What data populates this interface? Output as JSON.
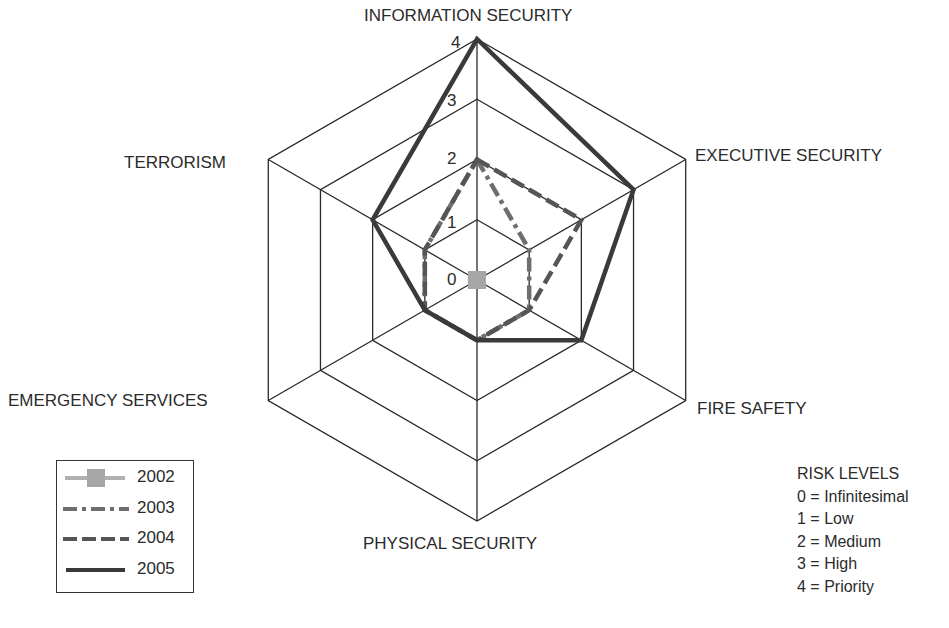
{
  "chart_data": {
    "type": "radar",
    "title": "",
    "axes": [
      "INFORMATION SECURITY",
      "EXECUTIVE SECURITY",
      "FIRE SAFETY",
      "PHYSICAL SECURITY",
      "EMERGENCY SERVICES",
      "TERRORISM"
    ],
    "range": [
      0,
      4
    ],
    "ticks": [
      "0",
      "1",
      "2",
      "3",
      "4"
    ],
    "grid": true,
    "legend_position": "bottom-left",
    "series": [
      {
        "name": "2002",
        "values": [
          0,
          0,
          0,
          0,
          0,
          0
        ],
        "style": "solid-marker",
        "color": "#a6a6a6"
      },
      {
        "name": "2003",
        "values": [
          2,
          1,
          1,
          1,
          1,
          1
        ],
        "style": "dash-dot",
        "color": "#6e6e6e"
      },
      {
        "name": "2004",
        "values": [
          2,
          2,
          1,
          1,
          1,
          1
        ],
        "style": "dashed",
        "color": "#555555"
      },
      {
        "name": "2005",
        "values": [
          4,
          3,
          2,
          1,
          1,
          2
        ],
        "style": "solid",
        "color": "#3a3a3a"
      }
    ]
  },
  "axis_labels": {
    "information_security": "INFORMATION SECURITY",
    "executive_security": "EXECUTIVE SECURITY",
    "fire_safety": "FIRE SAFETY",
    "physical_security": "PHYSICAL SECURITY",
    "emergency_services": "EMERGENCY SERVICES",
    "terrorism": "TERRORISM"
  },
  "ticks": [
    "0",
    "1",
    "2",
    "3",
    "4"
  ],
  "legend": {
    "items": [
      {
        "label": "2002"
      },
      {
        "label": "2003"
      },
      {
        "label": "2004"
      },
      {
        "label": "2005"
      }
    ]
  },
  "risk_levels": {
    "title": "RISK LEVELS",
    "items": [
      "0 = Infinitesimal",
      "1 = Low",
      "2 = Medium",
      "3 = High",
      "4 = Priority"
    ]
  }
}
